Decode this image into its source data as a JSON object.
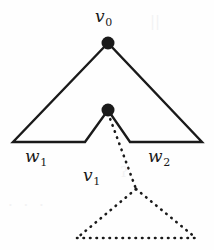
{
  "figure": {
    "name": "nested-triangle-tree-diagram",
    "background_color": "#fefefe",
    "stroke_color": "#1a1a1a",
    "label_color": "#1a1a1a",
    "width": 214,
    "height": 250
  },
  "labels": {
    "v0": {
      "base": "v",
      "sub": "0"
    },
    "v1": {
      "base": "v",
      "sub": "1"
    },
    "w1": {
      "base": "w",
      "sub": "1"
    },
    "w2": {
      "base": "w",
      "sub": "2"
    }
  },
  "nodes": [
    {
      "id": "v0",
      "name": "vertex-v0",
      "x": 108,
      "y": 43,
      "radius": 6.5,
      "filled": true
    },
    {
      "id": "v1",
      "name": "vertex-v1",
      "x": 108,
      "y": 110,
      "radius": 6.5,
      "filled": true
    }
  ],
  "solid_triangle": {
    "name": "outer-solid-triangle",
    "apex": [
      108,
      43
    ],
    "left_corner": [
      13,
      142
    ],
    "right_corner": [
      202,
      142
    ],
    "notch_left": [
      85,
      142
    ],
    "notch_apex": [
      108,
      110
    ],
    "notch_right": [
      130,
      142
    ],
    "stroke_width": 2.4,
    "style": "solid"
  },
  "dotted_triangle": {
    "name": "inner-dotted-triangle",
    "apex": [
      136,
      189
    ],
    "left_corner": [
      77,
      238
    ],
    "right_corner": [
      196,
      238
    ],
    "stroke_width": 2.6,
    "style": "dotted",
    "dash_pattern": "0.5 6"
  },
  "dotted_connector": {
    "name": "dotted-edge-v1-to-subtree",
    "from": [
      108,
      112
    ],
    "to": [
      136,
      189
    ],
    "stroke_width": 2.6,
    "style": "dotted",
    "dash_pattern": "0.5 6"
  },
  "artifacts": {
    "a": "||",
    "b": "· · ·",
    "c": "ʔ"
  }
}
